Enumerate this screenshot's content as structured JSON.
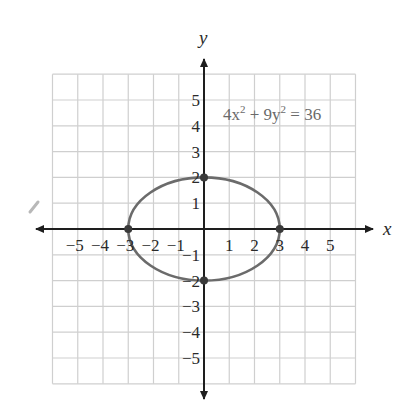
{
  "chart_data": {
    "type": "line",
    "title": "",
    "xlabel": "x",
    "ylabel": "y",
    "equation": "4x² + 9y² = 36",
    "equation_parts": {
      "a": "4x",
      "a_exp": "2",
      "op": " + 9y",
      "b_exp": "2",
      "rhs": " = 36"
    },
    "xlim": [
      -6,
      6
    ],
    "ylim": [
      -6,
      6
    ],
    "grid": true,
    "x_ticks": [
      "−5",
      "−4",
      "−3",
      "−2",
      "−1",
      "1",
      "2",
      "3",
      "4",
      "5"
    ],
    "y_ticks": [
      "5",
      "4",
      "3",
      "2",
      "1",
      "−1",
      "−2",
      "−3",
      "−4",
      "−5"
    ],
    "series": [
      {
        "name": "ellipse",
        "kind": "ellipse",
        "center": [
          0,
          0
        ],
        "semi_major_x": 3,
        "semi_minor_y": 2,
        "color": "#6b6b6b"
      }
    ],
    "points": [
      {
        "x": -3,
        "y": 0
      },
      {
        "x": 3,
        "y": 0
      },
      {
        "x": 0,
        "y": 2
      },
      {
        "x": 0,
        "y": -2
      }
    ],
    "colors": {
      "grid": "#cfcfcf",
      "axis": "#1e1e1e",
      "curve": "#6b6b6b",
      "point": "#3a3a3a"
    }
  }
}
